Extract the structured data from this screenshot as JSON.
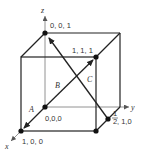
{
  "figure": {
    "type": "unit-cell-directions",
    "axes": {
      "x": "x",
      "y": "y",
      "z": "z"
    },
    "points": [
      {
        "id": "origin",
        "label": "0,0,0"
      },
      {
        "id": "p100",
        "label": "1, 0, 0"
      },
      {
        "id": "p001",
        "label": "0, 0, 1"
      },
      {
        "id": "p111",
        "label": "1, 1, 1"
      },
      {
        "id": "phalf10",
        "label_frac": "1/2",
        "label_num": "1",
        "label_den": "2",
        "label_rest": ", 1,0"
      }
    ],
    "vectors": [
      {
        "name": "A",
        "from": "0,0,0",
        "to": "1,0,0"
      },
      {
        "name": "B",
        "from": "0,0,0",
        "to": "1,1,1"
      },
      {
        "name": "C",
        "from": "1/2,1,0",
        "to": "0,0,1"
      }
    ],
    "colors": {
      "line": "#222222",
      "text": "#333333"
    }
  }
}
